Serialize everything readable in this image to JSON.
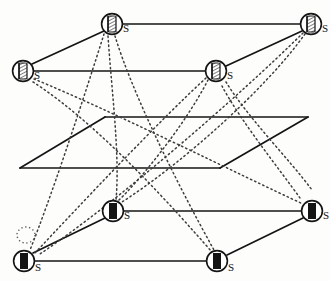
{
  "figure": {
    "type": "layered-graph-diagram",
    "background_color": "#fdfdfc",
    "ink_color": "#141414",
    "dotted_color": "#3c3c3c",
    "plane_count": 3,
    "node_count": 8,
    "node_label": "S"
  },
  "planes": [
    {
      "id": "top-plane",
      "name": "upper-layer",
      "corners": [
        [
          110,
          25
        ],
        [
          310,
          25
        ],
        [
          215,
          72
        ],
        [
          22,
          72
        ]
      ],
      "style": "solid"
    },
    {
      "id": "middle-plane",
      "name": "middle-layer",
      "corners": [
        [
          105,
          117
        ],
        [
          308,
          117
        ],
        [
          220,
          168
        ],
        [
          20,
          168
        ]
      ],
      "style": "solid"
    },
    {
      "id": "bottom-plane",
      "name": "lower-layer",
      "corners": [
        [
          110,
          212
        ],
        [
          310,
          212
        ],
        [
          215,
          262
        ],
        [
          22,
          262
        ]
      ],
      "style": "solid"
    }
  ],
  "nodes": [
    {
      "id": "n1",
      "name": "node-top-back-left",
      "label": "S",
      "cx": 112,
      "cy": 24,
      "r": 11,
      "glyph": "hatched",
      "layer": "top"
    },
    {
      "id": "n2",
      "name": "node-top-back-right",
      "label": "S",
      "cx": 311,
      "cy": 24,
      "r": 11,
      "glyph": "hatched",
      "layer": "top"
    },
    {
      "id": "n3",
      "name": "node-top-front-left",
      "label": "S",
      "cx": 23,
      "cy": 71,
      "r": 11,
      "glyph": "hatched",
      "layer": "top"
    },
    {
      "id": "n4",
      "name": "node-top-front-right",
      "label": "S",
      "cx": 216,
      "cy": 71,
      "r": 11,
      "glyph": "hatched",
      "layer": "top"
    },
    {
      "id": "n5",
      "name": "node-bottom-back-left",
      "label": "S",
      "cx": 113,
      "cy": 211,
      "r": 11,
      "glyph": "solid",
      "layer": "bottom"
    },
    {
      "id": "n6",
      "name": "node-bottom-back-right",
      "label": "S",
      "cx": 312,
      "cy": 211,
      "r": 11,
      "glyph": "solid",
      "layer": "bottom"
    },
    {
      "id": "n7",
      "name": "node-bottom-front-left",
      "label": "S",
      "cx": 24,
      "cy": 261,
      "r": 11,
      "glyph": "solid",
      "layer": "bottom"
    },
    {
      "id": "n8",
      "name": "node-bottom-front-right",
      "label": "S",
      "cx": 217,
      "cy": 261,
      "r": 11,
      "glyph": "solid",
      "layer": "bottom"
    }
  ],
  "edges_dotted": [
    {
      "name": "edge-n1-to-n8",
      "from": "n1",
      "to": "n8",
      "path": "M 115 36 C 132 92, 175 180, 214 250"
    },
    {
      "name": "edge-n1-to-n5",
      "from": "n1",
      "to": "n5",
      "path": "M 108 36 C 112 95, 120 155, 116 200"
    },
    {
      "name": "edge-n2-to-n7",
      "from": "n2",
      "to": "n7",
      "path": "M 303 33 C 240 95, 120 200, 40 254"
    },
    {
      "name": "edge-n2-to-n5",
      "from": "n2",
      "to": "n5",
      "path": "M 305 34 C 265 90, 180 165, 122 202"
    },
    {
      "name": "edge-n3-to-n6",
      "from": "n3",
      "to": "n6",
      "path": "M 34 79 C 110 110, 240 175, 303 204"
    },
    {
      "name": "edge-n3-to-n8",
      "from": "n3",
      "to": "n8",
      "path": "M 33 82 C 100 125, 175 210, 212 252"
    },
    {
      "name": "edge-n4-to-n7",
      "from": "n4",
      "to": "n7",
      "path": "M 206 78 C 160 120, 80 205, 34 254"
    },
    {
      "name": "edge-n4-to-n5",
      "from": "n4",
      "to": "n5",
      "path": "M 208 80 C 185 125, 140 180, 118 201"
    },
    {
      "name": "edge-n1-to-n7-long",
      "from": "n1",
      "to": "n7",
      "path": "M 104 34 C 80 110, 50 200, 30 250"
    }
  ],
  "self_loop": {
    "name": "self-loop-bottom-front-left",
    "attached_to": "n7",
    "cx": 26,
    "cy": 235,
    "rx": 9,
    "ry": 8
  }
}
